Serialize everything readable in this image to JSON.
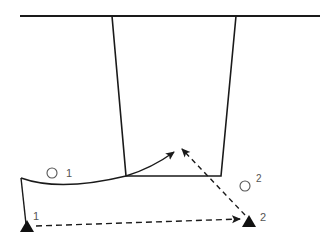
{
  "diagram": {
    "type": "surveying-tunnel-shaft-schematic",
    "colors": {
      "stroke": "#1a1a1a",
      "label": "#555555",
      "background": "#ffffff"
    },
    "ground_surface": {
      "from": [
        20,
        16
      ],
      "to": [
        320,
        16
      ]
    },
    "shaft": {
      "top_left": [
        112,
        16
      ],
      "top_right": [
        236,
        16
      ],
      "bottom_left": [
        126,
        176
      ],
      "bottom_right": [
        221,
        176
      ]
    },
    "tunnel_curve": {
      "start": [
        21,
        178
      ],
      "control": [
        60,
        192
      ],
      "end": [
        126,
        176
      ]
    },
    "stations": [
      {
        "id": "station-1",
        "label": "1",
        "marker": "triangle",
        "position": [
          26,
          226
        ]
      },
      {
        "id": "station-2",
        "label": "2",
        "marker": "triangle",
        "position": [
          249,
          220
        ]
      }
    ],
    "points": [
      {
        "id": "point-1",
        "label": "1",
        "marker": "circle",
        "position": [
          52,
          172
        ]
      },
      {
        "id": "point-2",
        "label": "2",
        "marker": "circle",
        "position": [
          245,
          185
        ]
      }
    ],
    "arrows": [
      {
        "id": "solid-arrow",
        "style": "solid",
        "from": [
          126,
          176
        ],
        "to": [
          174,
          152
        ]
      },
      {
        "id": "dashed-arrow-diagonal",
        "style": "dashed",
        "from": [
          245,
          215
        ],
        "to": [
          181,
          148
        ]
      },
      {
        "id": "dashed-arrow-horizontal",
        "style": "dashed",
        "from": [
          36,
          226
        ],
        "to": [
          240,
          219
        ]
      }
    ],
    "labels": {
      "station_1": "1",
      "station_2": "2",
      "point_1": "1",
      "point_2": "2"
    }
  }
}
